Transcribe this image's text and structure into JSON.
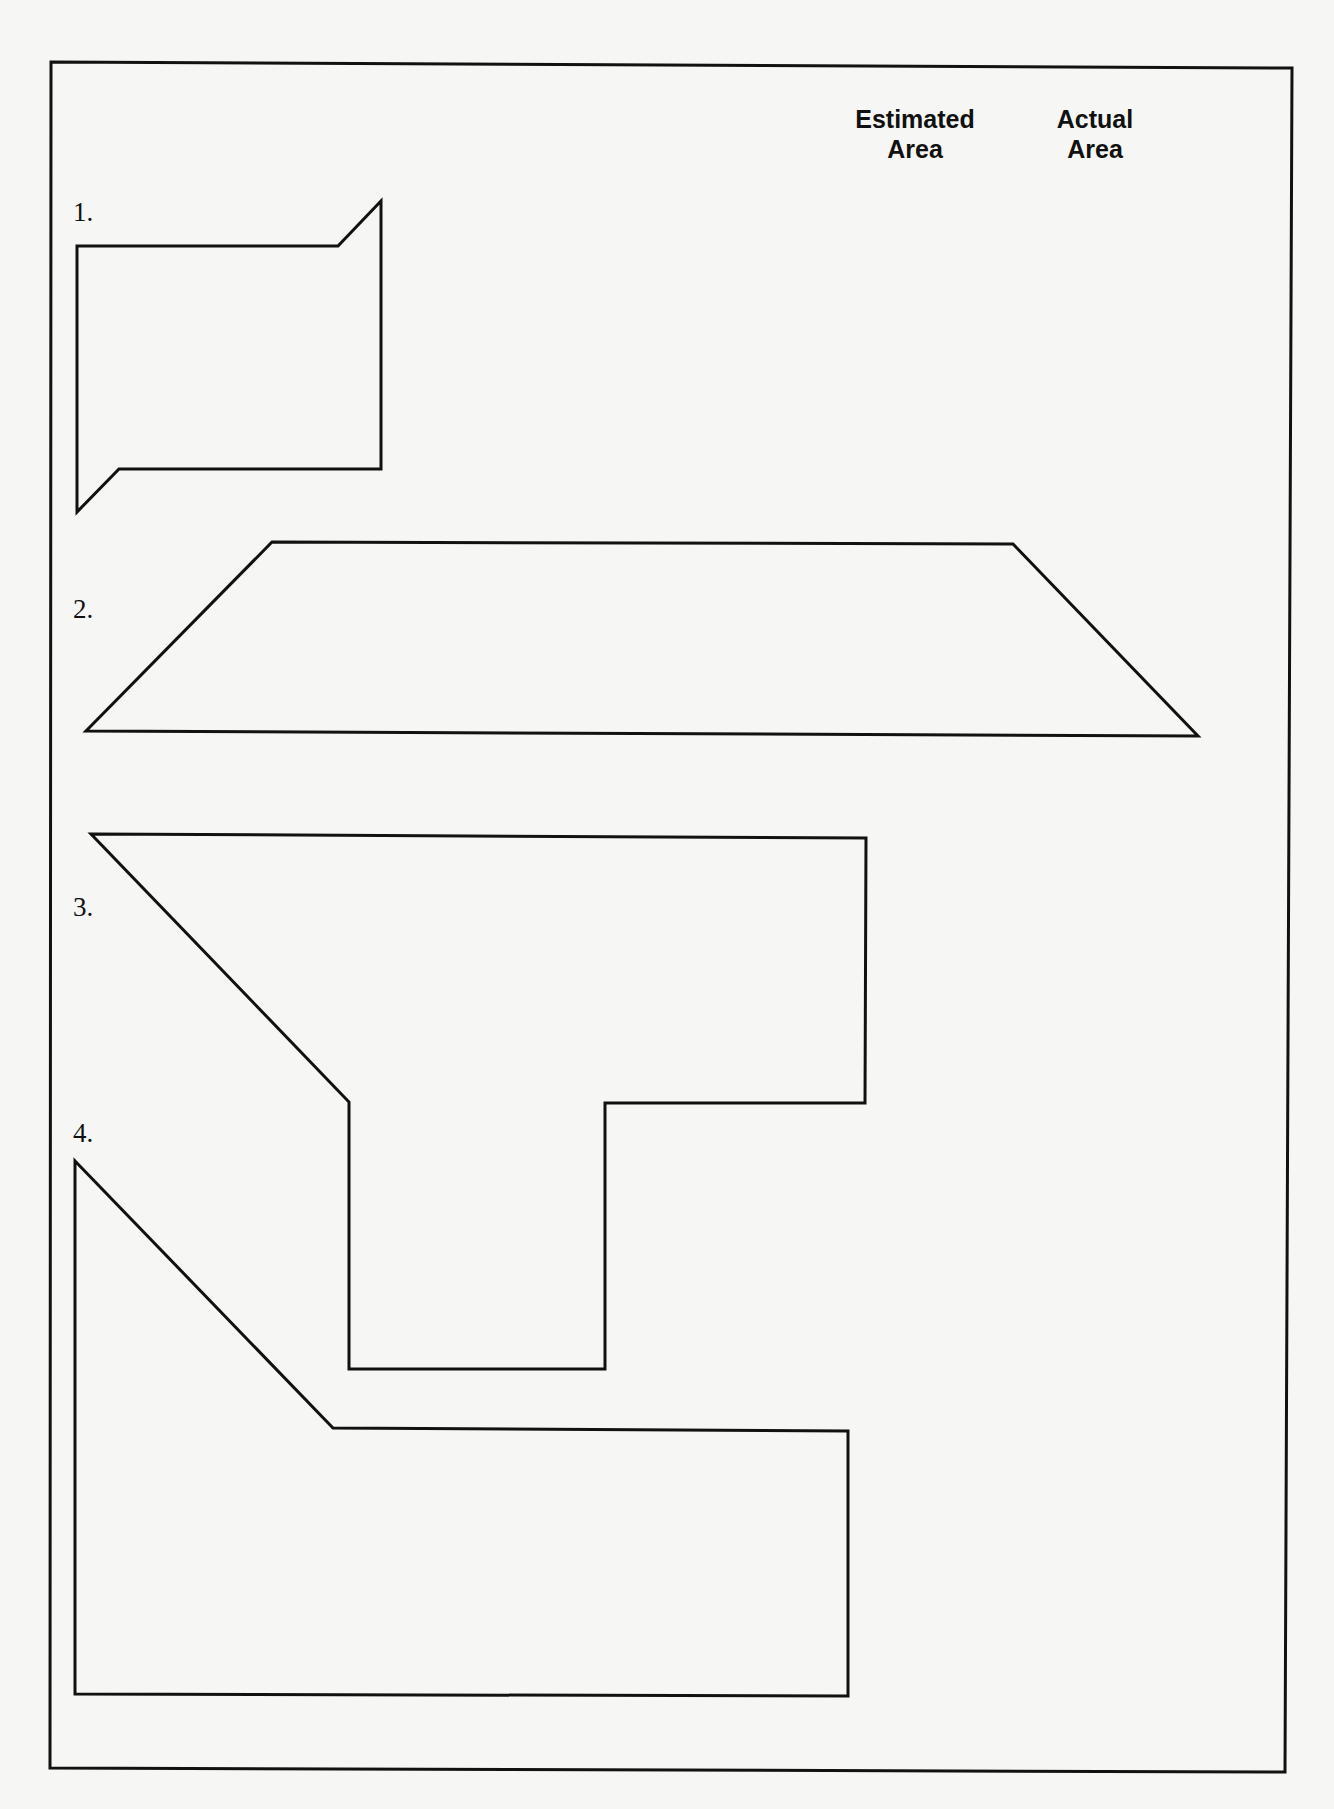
{
  "worksheet": {
    "columns": {
      "estimated": {
        "line1": "Estimated",
        "line2": "Area"
      },
      "actual": {
        "line1": "Actual",
        "line2": "Area"
      }
    },
    "problems": [
      {
        "label": "1.",
        "shape": "notched-rectangle",
        "points": "77,246 338,246 381,201 381,469 119,469 77,512",
        "estimated_area": "",
        "actual_area": ""
      },
      {
        "label": "2.",
        "shape": "trapezoid",
        "points": "272,542 1013,544 1198,736 86,731",
        "estimated_area": "",
        "actual_area": ""
      },
      {
        "label": "3.",
        "shape": "irregular-polygon",
        "points": "91,834 866,838 865,1103 605,1103 605,1369 349,1369 349,1102",
        "estimated_area": "",
        "actual_area": ""
      },
      {
        "label": "4.",
        "shape": "irregular-polygon",
        "points": "75,1161 333,1428 848,1431 848,1696 75,1694",
        "estimated_area": "",
        "actual_area": ""
      }
    ],
    "frame_points": "51,62 1292,68 1285,1772 50,1768",
    "stroke_color": "#111111",
    "paper_color": "#f6f6f4"
  }
}
